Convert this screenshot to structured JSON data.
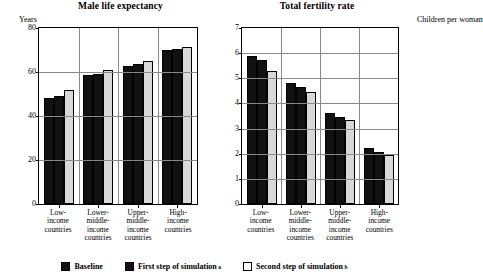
{
  "legend": {
    "items": [
      {
        "label": "Baseline",
        "marker": "dark",
        "note": ""
      },
      {
        "label": "First step of simulation",
        "marker": "dark",
        "note": "a"
      },
      {
        "label": "Second step of simulation",
        "marker": "light",
        "note": "b"
      }
    ]
  },
  "colors": {
    "baseline": "#111111",
    "first_step": "#111111",
    "second_step": "#d8d8d8",
    "gridline": "#8a8a8a",
    "axis": "#000000"
  },
  "chart_data": [
    {
      "type": "bar",
      "title": "Male life expectancy",
      "ylabel": "Years",
      "xlabel": "",
      "categories": [
        "Low-income countries",
        "Lower-middle-income countries",
        "Upper-middle-income countries",
        "High-income countries"
      ],
      "category_lines": [
        [
          "Low-",
          "income",
          "countries"
        ],
        [
          "Lower-",
          "middle-",
          "income",
          "countries"
        ],
        [
          "Upper-",
          "middle-",
          "income",
          "countries"
        ],
        [
          "High-",
          "income",
          "countries"
        ]
      ],
      "series": [
        {
          "name": "Baseline",
          "values": [
            48.0,
            58.5,
            62.8,
            70.0
          ]
        },
        {
          "name": "First step of simulation",
          "values": [
            49.0,
            59.3,
            63.5,
            70.4
          ]
        },
        {
          "name": "Second step of simulation",
          "values": [
            51.8,
            60.7,
            64.8,
            71.3
          ]
        }
      ],
      "ylim": [
        0,
        80
      ],
      "yticks": [
        0,
        20,
        40,
        60,
        80
      ],
      "grid": true,
      "legend_position": "bottom"
    },
    {
      "type": "bar",
      "title": "Total fertility rate",
      "ylabel": "Children per woman",
      "xlabel": "",
      "categories": [
        "Low-income countries",
        "Lower-middle-income countries",
        "Upper-middle-income countries",
        "High-income countries"
      ],
      "category_lines": [
        [
          "Low-",
          "income",
          "countries"
        ],
        [
          "Lower-",
          "middle-",
          "income",
          "countries"
        ],
        [
          "Upper-",
          "middle-",
          "income",
          "countries"
        ],
        [
          "High-",
          "income",
          "countries"
        ]
      ],
      "series": [
        {
          "name": "Baseline",
          "values": [
            5.9,
            4.82,
            3.63,
            2.22
          ]
        },
        {
          "name": "First step of simulation",
          "values": [
            5.72,
            4.66,
            3.47,
            2.06
          ]
        },
        {
          "name": "Second step of simulation",
          "values": [
            5.28,
            4.44,
            3.35,
            1.95
          ]
        }
      ],
      "ylim": [
        0,
        7
      ],
      "yticks": [
        0,
        1,
        2,
        3,
        4,
        5,
        6,
        7
      ],
      "grid": true,
      "legend_position": "bottom"
    }
  ]
}
